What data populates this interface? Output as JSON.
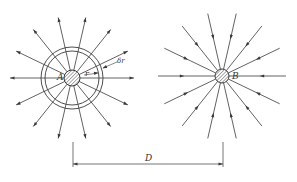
{
  "diagram": {
    "colors": {
      "line": "#3a3a3a",
      "hatch": "#555555",
      "background": "#ffffff"
    },
    "charge_a": {
      "label": "A",
      "center": [
        72,
        78
      ],
      "core_radius": 8,
      "shell_inner_radius": 27,
      "shell_outer_radius": 31,
      "spoke_radius": 62,
      "spoke_count": 14,
      "direction": "outward",
      "radius_label": "r",
      "shell_label": "δr"
    },
    "charge_b": {
      "label": "B",
      "center": [
        222,
        76
      ],
      "core_radius": 7,
      "spoke_radius": 64,
      "spoke_count": 14,
      "direction": "inward"
    },
    "dimension": {
      "label": "D",
      "y": 164,
      "x_start": 73,
      "x_end": 223
    }
  }
}
